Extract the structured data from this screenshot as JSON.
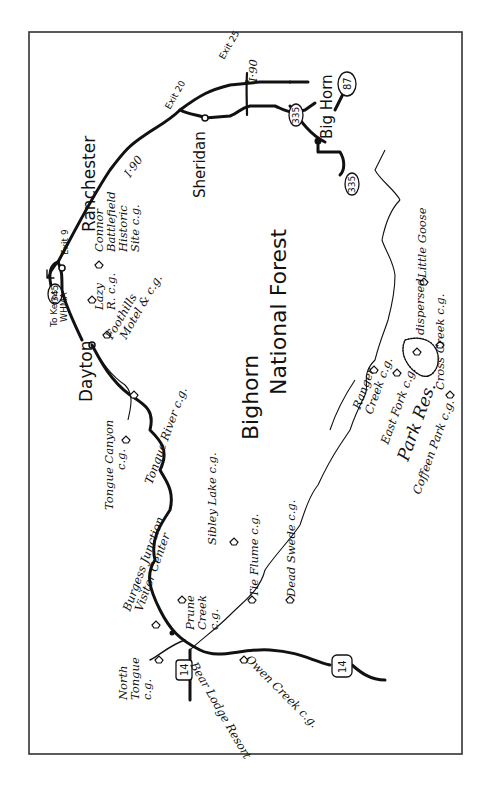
{
  "page": {
    "page_number": ""
  },
  "map": {
    "title_line1": "Bighorn",
    "title_line2": "National Forest",
    "orientation": "rotated 90° counter-clockwise (north to the right)",
    "towns": [
      {
        "name": "Ranchester"
      },
      {
        "name": "Dayton"
      },
      {
        "name": "Sheridan"
      },
      {
        "name": "Big Horn"
      }
    ],
    "highways": {
      "interstate": "I·90",
      "exit9": "Exit 9",
      "exit20": "Exit 20",
      "exit25": "Exit 25",
      "us87": "87",
      "us14_north": "14",
      "us14_south": "14",
      "sr335_a": "335",
      "sr335_b": "335",
      "sr345": "345",
      "to_kerns_line1": "To Kerns",
      "to_kerns_line2": "WHMA"
    },
    "campgrounds": {
      "connor_1": "Connor",
      "connor_2": "Battlefield",
      "connor_3": "Historic",
      "connor_4": "Site c.g.",
      "lazy_1": "Lazy",
      "lazy_2": "R. c.g.",
      "foothills_1": "Foothills",
      "foothills_2": "Motel & c.g.",
      "tongue_canyon_1": "Tongue Canyon",
      "tongue_canyon_2": "c.g.",
      "tongue_river": "Tongue River c.g.",
      "sibley_lake": "Sibley Lake c.g.",
      "tie_flume": "Tie Flume c.g.",
      "dead_swede": "Dead Swede c.g.",
      "ranger_creek_1": "Ranger",
      "ranger_creek_2": "Creek c.g.",
      "east_fork": "East Fork c.g.",
      "park_res": "Park Res.",
      "coffeen_park": "Coffeen Park c.g.",
      "cross_creek": "Cross Creek c.g.",
      "dispersed": "dispersed",
      "little_goose": "Little Goose",
      "burgess_1": "Burgess Junction",
      "burgess_2": "Visitor Center",
      "prune_1": "Prune",
      "prune_2": "Creek",
      "prune_3": "c.g.",
      "north_tongue_1": "North",
      "north_tongue_2": "Tongue",
      "north_tongue_3": "c.g.",
      "bear_lodge": "Bear Lodge Resort",
      "owen_creek": "Owen Creek c.g."
    }
  }
}
